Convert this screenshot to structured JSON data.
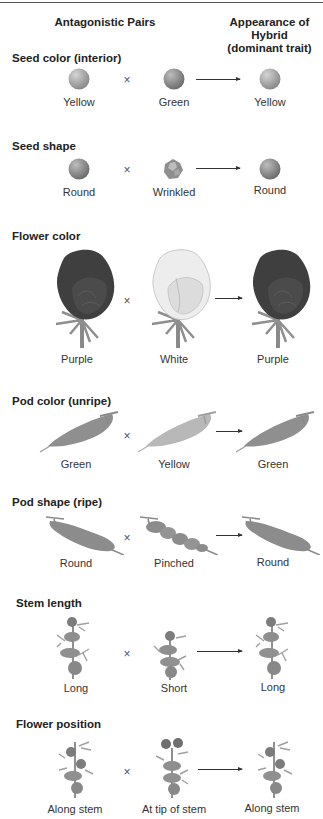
{
  "header": {
    "left": "Antagonistic Pairs",
    "right_line1": "Appearance of Hybrid",
    "right_line2": "(dominant trait)"
  },
  "symbols": {
    "cross": "×"
  },
  "colors": {
    "seed": "#8d8d8d",
    "seed_highlight": "#d0d0d0",
    "seed_dark": "#7a7a7a",
    "flower_dark": "#3e3e3e",
    "flower_white": "#ececec",
    "stem": "#8a8a8a",
    "pod_green": "#8f8f8f",
    "pod_yellow": "#b5b5b5",
    "plant": "#909090"
  },
  "traits": [
    {
      "title": "Seed color (interior)",
      "parent1": "Yellow",
      "parent2": "Green",
      "hybrid": "Yellow",
      "icon": "seed"
    },
    {
      "title": "Seed shape",
      "parent1": "Round",
      "parent2": "Wrinkled",
      "hybrid": "Round",
      "icon": "seed"
    },
    {
      "title": "Flower color",
      "parent1": "Purple",
      "parent2": "White",
      "hybrid": "Purple",
      "icon": "flower"
    },
    {
      "title": "Pod color (unripe)",
      "parent1": "Green",
      "parent2": "Yellow",
      "hybrid": "Green",
      "icon": "pod"
    },
    {
      "title": "Pod shape (ripe)",
      "parent1": "Round",
      "parent2": "Pinched",
      "hybrid": "Round",
      "icon": "pod"
    },
    {
      "title": "Stem length",
      "parent1": "Long",
      "parent2": "Short",
      "hybrid": "Long",
      "icon": "plant"
    },
    {
      "title": "Flower position",
      "parent1": "Along stem",
      "parent2": "At tip of stem",
      "hybrid": "Along stem",
      "icon": "plant"
    }
  ]
}
